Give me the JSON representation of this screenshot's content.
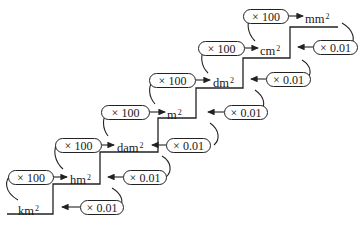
{
  "diagram": {
    "title": "",
    "units": [
      {
        "base": "km",
        "exp": "2"
      },
      {
        "base": "hm",
        "exp": "2"
      },
      {
        "base": "dam",
        "exp": "2"
      },
      {
        "base": "m",
        "exp": "2"
      },
      {
        "base": "dm",
        "exp": "2"
      },
      {
        "base": "cm",
        "exp": "2"
      },
      {
        "base": "mm",
        "exp": "2"
      }
    ],
    "up_label": "× 100",
    "down_label": "× 0.01",
    "up_steps": [
      {
        "from": "km²",
        "to": "hm²",
        "label": "× 100"
      },
      {
        "from": "hm²",
        "to": "dam²",
        "label": "× 100"
      },
      {
        "from": "dam²",
        "to": "m²",
        "label": "× 100"
      },
      {
        "from": "m²",
        "to": "dm²",
        "label": "× 100"
      },
      {
        "from": "dm²",
        "to": "cm²",
        "label": "× 100"
      },
      {
        "from": "cm²",
        "to": "mm²",
        "label": "× 100"
      }
    ],
    "down_steps": [
      {
        "from": "mm²",
        "to": "cm²",
        "label": "× 0.01"
      },
      {
        "from": "cm²",
        "to": "dm²",
        "label": "× 0.01"
      },
      {
        "from": "dm²",
        "to": "m²",
        "label": "× 0.01"
      },
      {
        "from": "m²",
        "to": "dam²",
        "label": "× 0.01"
      },
      {
        "from": "dam²",
        "to": "hm²",
        "label": "× 0.01"
      },
      {
        "from": "hm²",
        "to": "km²",
        "label": "× 0.01"
      }
    ]
  }
}
